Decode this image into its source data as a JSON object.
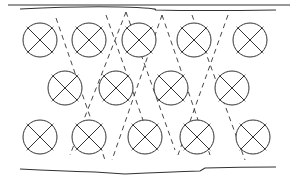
{
  "diagram": {
    "stroke_color": "#333333",
    "rows": [
      {
        "y": 40,
        "x": [
          40,
          89,
          139,
          194,
          250
        ]
      },
      {
        "y": 88,
        "x": [
          65,
          116,
          171,
          232
        ]
      },
      {
        "y": 137,
        "x": [
          40,
          89,
          145,
          197,
          253
        ]
      }
    ],
    "radius": 17
  }
}
